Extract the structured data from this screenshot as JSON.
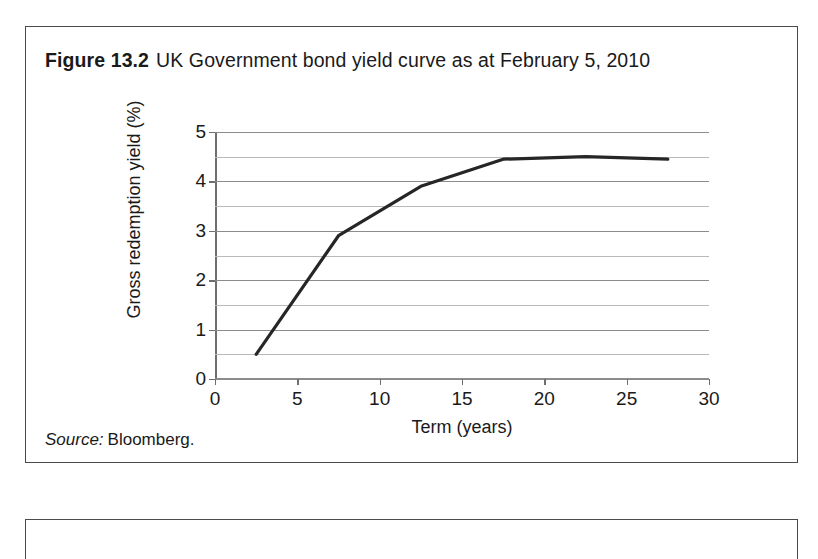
{
  "figure": {
    "label": "Figure 13.2",
    "title": "UK Government bond yield curve as at February 5, 2010",
    "source_label": "Source:",
    "source_value": "Bloomberg."
  },
  "chart_data": {
    "type": "line",
    "title": "UK Government bond yield curve as at February 5, 2010",
    "xlabel": "Term (years)",
    "ylabel": "Gross redemption yield (%)",
    "xlim": [
      0,
      30
    ],
    "ylim": [
      0,
      5
    ],
    "xticks": [
      0,
      5,
      10,
      15,
      20,
      25,
      30
    ],
    "xtick_labels": [
      "0",
      "5",
      "10",
      "15",
      "20",
      "25",
      "30"
    ],
    "yticks": [
      0,
      1,
      2,
      3,
      4,
      5
    ],
    "ytick_labels": [
      "0",
      "1",
      "2",
      "3",
      "4",
      "5"
    ],
    "grid": true,
    "gridlines_y": [
      0,
      0.5,
      1,
      1.5,
      2,
      2.5,
      3,
      3.5,
      4,
      4.5,
      5
    ],
    "legend": null,
    "line_color": "#262626",
    "line_width": 3.2,
    "series": [
      {
        "name": "Gross redemption yield",
        "x": [
          2.5,
          7.5,
          12.5,
          17.5,
          22.5,
          27.5
        ],
        "y": [
          0.5,
          2.9,
          3.9,
          4.45,
          4.5,
          4.45
        ]
      }
    ]
  }
}
